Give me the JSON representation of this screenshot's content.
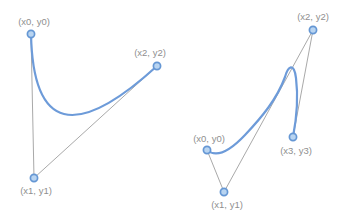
{
  "figure": {
    "width": 347,
    "height": 216,
    "background": "#ffffff"
  },
  "colors": {
    "curve": "#6d9bd9",
    "point_fill": "#b8d4f1",
    "point_stroke": "#6597d4",
    "guide_line": "#a9a9a9",
    "label_text": "#8f8f8f"
  },
  "stroke_widths": {
    "curve": 2.2,
    "guide_line": 1,
    "point_ring": 1.7
  },
  "point_radius": 3.6,
  "diagrams": [
    {
      "name": "quadratic-bezier",
      "points": [
        {
          "id": "p0",
          "label": "(x0, y0)",
          "x": 31,
          "y": 34,
          "label_x": 34,
          "label_y": 21,
          "label_pos": "above"
        },
        {
          "id": "p1",
          "label": "(x1, y1)",
          "x": 34,
          "y": 178,
          "label_x": 36,
          "label_y": 190,
          "label_pos": "below"
        },
        {
          "id": "p2",
          "label": "(x2, y2)",
          "x": 157,
          "y": 66,
          "label_x": 150,
          "label_y": 52,
          "label_pos": "above"
        }
      ],
      "guide_lines": [
        [
          "p0",
          "p1"
        ],
        [
          "p1",
          "p2"
        ]
      ],
      "curve_path": "M 31 34 Q 34 178 157 66"
    },
    {
      "name": "cubic-bezier",
      "points": [
        {
          "id": "p0",
          "label": "(x0, y0)",
          "x": 207,
          "y": 150,
          "label_x": 209,
          "label_y": 138,
          "label_pos": "above"
        },
        {
          "id": "p1",
          "label": "(x1, y1)",
          "x": 224,
          "y": 192,
          "label_x": 227,
          "label_y": 204,
          "label_pos": "below"
        },
        {
          "id": "p2",
          "label": "(x2, y2)",
          "x": 313,
          "y": 30,
          "label_x": 313,
          "label_y": 16,
          "label_pos": "above"
        },
        {
          "id": "p3",
          "label": "(x3, y3)",
          "x": 293,
          "y": 137,
          "label_x": 296,
          "label_y": 150,
          "label_pos": "below"
        }
      ],
      "guide_lines": [
        [
          "p0",
          "p1"
        ],
        [
          "p1",
          "p2"
        ],
        [
          "p2",
          "p3"
        ]
      ],
      "curve_path": "M 207 150 C 215 157 228 153 245 135 C 262 117 277 99 285 77 C 288 66 294 62 296 78 C 298 94 297 116 293 137"
    }
  ]
}
